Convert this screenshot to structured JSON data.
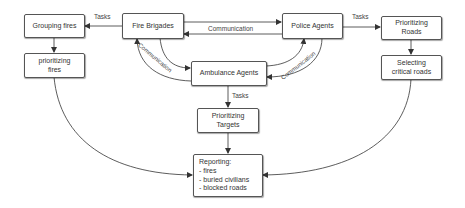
{
  "diagram": {
    "nodes": {
      "grouping_fires": "Grouping fires",
      "prioritizing_fires": "prioritizing fires",
      "fire_brigades": "Fire Brigades",
      "police_agents": "Police Agents",
      "prioritizing_roads": "Prioritizing Roads",
      "selecting_critical_roads": "Selecting critical roads",
      "ambulance_agents": "Ambulance Agents",
      "prioritizing_targets": "Prioritizing Targets",
      "reporting": {
        "title": "Reporting:",
        "items": [
          "- fires",
          "- buried civilians",
          "- blocked roads"
        ]
      }
    },
    "edge_labels": {
      "fb_to_grouping": "Tasks",
      "police_to_roads": "Tasks",
      "fb_police": "Communication",
      "fb_ambulance": "Communication",
      "police_ambulance": "Communication",
      "ambulance_to_targets": "Tasks"
    },
    "colors": {
      "line": "#333333",
      "border": "#555555",
      "text": "#333333"
    }
  }
}
